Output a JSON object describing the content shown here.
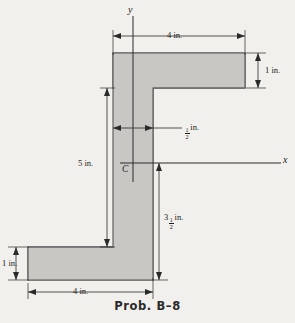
{
  "page": {
    "header_scrap": "",
    "background_color": "#f2f0ec",
    "caption": "Prob. B–8"
  },
  "figure": {
    "shape_name": "z-section",
    "fill_color": "#c9c7c4",
    "stroke_color": "#4a4a4a",
    "axes": {
      "x_label": "x",
      "y_label": "y",
      "centroid_label": "C"
    },
    "dimensions": [
      {
        "id": "top-flange-width",
        "text": "4 in.",
        "value": 4,
        "unit": "in.",
        "orientation": "horizontal",
        "location": "top"
      },
      {
        "id": "top-flange-thickness",
        "text": "1 in.",
        "value": 1,
        "unit": "in.",
        "orientation": "vertical",
        "location": "right"
      },
      {
        "id": "web-thickness",
        "whole": "",
        "numerator": "1",
        "denominator": "2",
        "unit": "in.",
        "text": "1/2 in.",
        "value": 0.5,
        "orientation": "horizontal",
        "location": "middle"
      },
      {
        "id": "height-above-bottom-flange",
        "text": "5 in.",
        "value": 5,
        "unit": "in.",
        "orientation": "vertical",
        "location": "left"
      },
      {
        "id": "centroid-to-bottom",
        "whole": "3",
        "numerator": "1",
        "denominator": "2",
        "unit": "in.",
        "text": "3 1/2 in.",
        "value": 3.5,
        "orientation": "vertical",
        "location": "lower-right"
      },
      {
        "id": "bottom-flange-thickness",
        "text": "1 in.",
        "value": 1,
        "unit": "in.",
        "orientation": "vertical",
        "location": "bottom-left"
      },
      {
        "id": "bottom-flange-width",
        "text": "4 in.",
        "value": 4,
        "unit": "in.",
        "orientation": "horizontal",
        "location": "bottom"
      }
    ]
  }
}
